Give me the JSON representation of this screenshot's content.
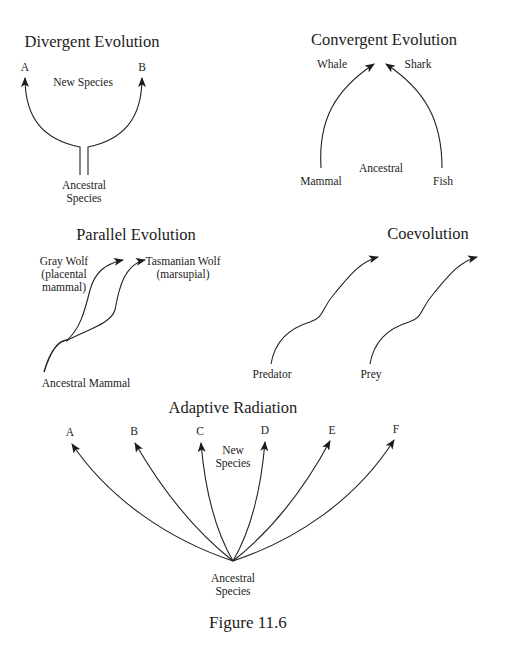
{
  "figure": {
    "caption": "Figure 11.6",
    "panels": {
      "divergent": {
        "title": "Divergent Evolution",
        "label_a": "A",
        "label_b": "B",
        "new_species": "New Species",
        "ancestral_line1": "Ancestral",
        "ancestral_line2": "Species"
      },
      "convergent": {
        "title": "Convergent Evolution",
        "whale": "Whale",
        "shark": "Shark",
        "mammal": "Mammal",
        "fish": "Fish",
        "ancestral": "Ancestral"
      },
      "parallel": {
        "title": "Parallel Evolution",
        "gray_wolf_line1": "Gray Wolf",
        "gray_wolf_line2": "(placental",
        "gray_wolf_line3": "mammal)",
        "tasmanian_line1": "Tasmanian Wolf",
        "tasmanian_line2": "(marsupial)",
        "ancestral": "Ancestral Mammal"
      },
      "coevolution": {
        "title": "Coevolution",
        "predator": "Predator",
        "prey": "Prey"
      },
      "adaptive": {
        "title": "Adaptive Radiation",
        "species": [
          "A",
          "B",
          "C",
          "D",
          "E",
          "F"
        ],
        "new_species_line1": "New",
        "new_species_line2": "Species",
        "ancestral_line1": "Ancestral",
        "ancestral_line2": "Species"
      }
    }
  }
}
